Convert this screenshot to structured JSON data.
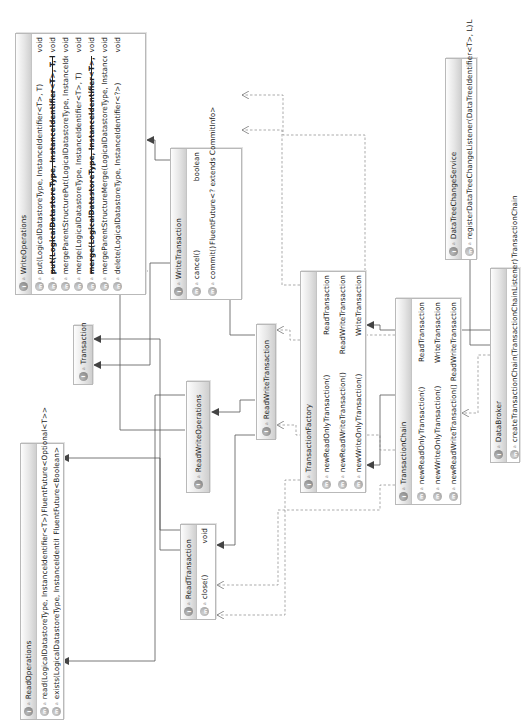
{
  "diagram": {
    "type": "uml-class-diagram",
    "orientation": "rotated-90-ccw",
    "colors": {
      "box_border": "#b9b9b9",
      "header_gradient_top": "#fdfdfd",
      "header_gradient_bottom": "#cfcfcf",
      "line": "#555555",
      "icon": "#8a8a8a"
    },
    "classes": {
      "write_operations": {
        "name": "WriteOperations",
        "icon": "interface-icon",
        "methods": [
          {
            "sig": "put(LogicalDatastoreType, InstanceIdentifier<T>, T)",
            "ret": "void",
            "deprecated": false
          },
          {
            "sig": "put(LogicalDatastoreType, InstanceIdentifier<T>, T, boolean)",
            "ret": "void",
            "deprecated": true
          },
          {
            "sig": "mergeParentStructurePut(LogicalDatastoreType, InstanceIdentifier<T>, T)",
            "ret": "void",
            "deprecated": false
          },
          {
            "sig": "merge(LogicalDatastoreType, InstanceIdentifier<T>, T)",
            "ret": "void",
            "deprecated": false
          },
          {
            "sig": "merge(LogicalDatastoreType, InstanceIdentifier<T>, T, boolean)",
            "ret": "void",
            "deprecated": true
          },
          {
            "sig": "mergeParentStructureMerge(LogicalDatastoreType, InstanceIdentifier<T>, T)",
            "ret": "void",
            "deprecated": false
          },
          {
            "sig": "delete(LogicalDatastoreType, InstanceIdentifier<?>)",
            "ret": "void",
            "deprecated": false
          }
        ]
      },
      "read_operations": {
        "name": "ReadOperations",
        "icon": "interface-icon",
        "methods": [
          {
            "sig": "read(LogicalDatastoreType, InstanceIdentifier<T>)",
            "ret": "FluentFuture<Optional<T>>"
          },
          {
            "sig": "exists(LogicalDatastoreType, InstanceIdentifier<?>)",
            "ret": "FluentFuture<Boolean>"
          }
        ]
      },
      "transaction": {
        "name": "Transaction",
        "icon": "interface-icon",
        "methods": []
      },
      "read_write_operations": {
        "name": "ReadWriteOperations",
        "icon": "interface-icon",
        "methods": []
      },
      "read_transaction": {
        "name": "ReadTransaction",
        "icon": "interface-icon",
        "methods": [
          {
            "sig": "close()",
            "ret": "void"
          }
        ]
      },
      "write_transaction": {
        "name": "WriteTransaction",
        "icon": "interface-icon",
        "methods": [
          {
            "sig": "cancel()",
            "ret": "boolean"
          },
          {
            "sig": "commit()",
            "ret": "FluentFuture<? extends CommitInfo>"
          }
        ]
      },
      "read_write_transaction": {
        "name": "ReadWriteTransaction",
        "icon": "interface-icon",
        "methods": []
      },
      "transaction_factory": {
        "name": "TransactionFactory",
        "icon": "interface-icon",
        "methods": [
          {
            "sig": "newReadOnlyTransaction()",
            "ret": "ReadTransaction"
          },
          {
            "sig": "newReadWriteTransaction()",
            "ret": "ReadWriteTransaction"
          },
          {
            "sig": "newWriteOnlyTransaction()",
            "ret": "WriteTransaction"
          }
        ]
      },
      "transaction_chain": {
        "name": "TransactionChain",
        "icon": "interface-icon",
        "methods": [
          {
            "sig": "newReadOnlyTransaction()",
            "ret": "ReadTransaction"
          },
          {
            "sig": "newWriteOnlyTransaction()",
            "ret": "WriteTransaction"
          },
          {
            "sig": "newReadWriteTransaction()",
            "ret": "ReadWriteTransaction"
          }
        ]
      },
      "data_tree_change_service": {
        "name": "DataTreeChangeService",
        "icon": "interface-icon",
        "methods": [
          {
            "sig": "registerDataTreeChangeListener(DataTreeIdentifier<T>, L)",
            "ret": "L"
          }
        ]
      },
      "data_broker": {
        "name": "DataBroker",
        "icon": "interface-icon",
        "methods": [
          {
            "sig": "createTransactionChain(TransactionChainListener)",
            "ret": "TransactionChain"
          }
        ]
      }
    },
    "relations": [
      {
        "from": "ReadWriteOperations",
        "to": "ReadOperations",
        "kind": "extends"
      },
      {
        "from": "ReadWriteOperations",
        "to": "WriteOperations",
        "kind": "extends"
      },
      {
        "from": "ReadTransaction",
        "to": "ReadOperations",
        "kind": "extends"
      },
      {
        "from": "ReadTransaction",
        "to": "Transaction",
        "kind": "extends"
      },
      {
        "from": "WriteTransaction",
        "to": "WriteOperations",
        "kind": "extends"
      },
      {
        "from": "WriteTransaction",
        "to": "Transaction",
        "kind": "extends"
      },
      {
        "from": "ReadWriteTransaction",
        "to": "ReadWriteOperations",
        "kind": "extends"
      },
      {
        "from": "ReadWriteTransaction",
        "to": "WriteTransaction",
        "kind": "extends"
      },
      {
        "from": "ReadWriteTransaction",
        "to": "ReadTransaction",
        "kind": "extends"
      },
      {
        "from": "TransactionChain",
        "to": "TransactionFactory",
        "kind": "extends"
      },
      {
        "from": "DataBroker",
        "to": "TransactionFactory",
        "kind": "extends"
      },
      {
        "from": "DataBroker",
        "to": "DataTreeChangeService",
        "kind": "extends"
      },
      {
        "from": "TransactionFactory",
        "to": "ReadTransaction",
        "kind": "depends"
      },
      {
        "from": "TransactionFactory",
        "to": "WriteTransaction",
        "kind": "depends"
      },
      {
        "from": "TransactionFactory",
        "to": "ReadWriteTransaction",
        "kind": "depends"
      },
      {
        "from": "TransactionChain",
        "to": "ReadTransaction",
        "kind": "depends"
      },
      {
        "from": "TransactionChain",
        "to": "WriteTransaction",
        "kind": "depends"
      },
      {
        "from": "TransactionChain",
        "to": "ReadWriteTransaction",
        "kind": "depends"
      },
      {
        "from": "DataBroker",
        "to": "TransactionChain",
        "kind": "depends"
      }
    ]
  }
}
